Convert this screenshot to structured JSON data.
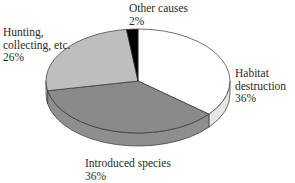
{
  "chart_data": {
    "type": "pie",
    "style": "3d",
    "title": "",
    "slices": [
      {
        "label": "Habitat destruction",
        "value": 36,
        "value_label": "36%",
        "color": "#ffffff",
        "side_color": "#e6e6e6"
      },
      {
        "label": "Introduced species",
        "value": 36,
        "value_label": "36%",
        "color": "#8a8a8a",
        "side_color": "#8e8e8e"
      },
      {
        "label": "Hunting, collecting, etc.",
        "value": 26,
        "value_label": "26%",
        "color": "#bebebe",
        "side_color": "#b0b0b0"
      },
      {
        "label": "Other causes",
        "value": 2,
        "value_label": "2%",
        "color": "#000000",
        "side_color": "#000000"
      }
    ],
    "start_angle_deg": -90,
    "direction": "clockwise",
    "legend": "none (direct labels)"
  },
  "labels": {
    "other": {
      "line1": "Other causes",
      "line2": "2%"
    },
    "hunting": {
      "line1": "Hunting,",
      "line2": "collecting, etc.",
      "line3": "26%"
    },
    "habitat": {
      "line1": "Habitat",
      "line2": "destruction",
      "line3": "36%"
    },
    "introduced": {
      "line1": "Introduced species",
      "line2": "36%"
    }
  }
}
